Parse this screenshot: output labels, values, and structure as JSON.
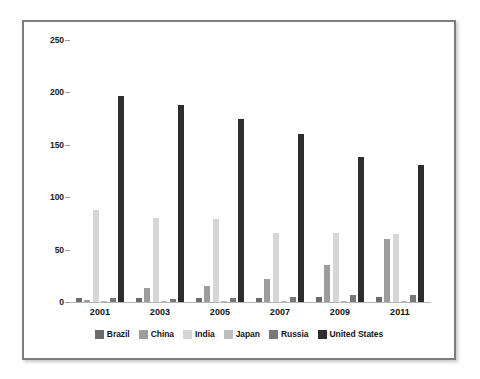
{
  "chart_data": {
    "type": "bar",
    "title": "",
    "xlabel": "",
    "ylabel": "",
    "ylim": [
      0,
      250
    ],
    "yticks": [
      0,
      50,
      100,
      150,
      200,
      250
    ],
    "grid": true,
    "legend_position": "bottom",
    "categories": [
      "2001",
      "2003",
      "2005",
      "2007",
      "2009",
      "2011"
    ],
    "series": [
      {
        "name": "Brazil",
        "color": "#6b6b6b",
        "values": [
          4,
          4,
          4,
          4,
          5,
          5
        ]
      },
      {
        "name": "China",
        "color": "#9d9d9d",
        "values": [
          2,
          13,
          15,
          22,
          35,
          60
        ]
      },
      {
        "name": "India",
        "color": "#d6d6d6",
        "values": [
          88,
          80,
          79,
          66,
          66,
          65
        ]
      },
      {
        "name": "Japan",
        "color": "#bdbdbd",
        "values": [
          1,
          1,
          1,
          1,
          1,
          1
        ]
      },
      {
        "name": "Russia",
        "color": "#787878",
        "values": [
          4,
          3,
          4,
          5,
          7,
          7
        ]
      },
      {
        "name": "United States",
        "color": "#2e2e2e",
        "values": [
          197,
          188,
          175,
          160,
          138,
          131
        ]
      }
    ]
  },
  "axis": {
    "y_tick_labels": [
      "0",
      "50",
      "100",
      "150",
      "200",
      "250"
    ],
    "x_tick_labels": [
      "2001",
      "2003",
      "2005",
      "2007",
      "2009",
      "2011"
    ]
  },
  "legend": {
    "items": [
      {
        "label": "Brazil"
      },
      {
        "label": "China"
      },
      {
        "label": "India"
      },
      {
        "label": "Japan"
      },
      {
        "label": "Russia"
      },
      {
        "label": "United States"
      }
    ]
  },
  "colors": {
    "frame_border": "#7d7d7d",
    "gridline": "#c9c9c9",
    "background": "#ffffff",
    "text": "#141414"
  }
}
